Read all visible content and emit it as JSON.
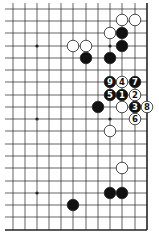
{
  "diagram": {
    "type": "go-board-partial",
    "grid": {
      "x0": 5,
      "xs": [
        13,
        25,
        37,
        49,
        61,
        73,
        86,
        98,
        110,
        122,
        135,
        147
      ],
      "ys": [
        9,
        21,
        33,
        46,
        58,
        70,
        82,
        95,
        107,
        119,
        131,
        144,
        156,
        168,
        181,
        193,
        205,
        217,
        230
      ],
      "top_edge_open": true,
      "left_edge_open": true,
      "right_edge": 147,
      "bottom_edge": 230
    },
    "hoshi": [
      [
        37,
        46
      ],
      [
        110,
        46
      ],
      [
        37,
        119
      ],
      [
        110,
        119
      ],
      [
        37,
        193
      ]
    ],
    "stones": [
      {
        "color": "white",
        "x": 122,
        "y": 20,
        "label": ""
      },
      {
        "color": "white",
        "x": 135,
        "y": 20,
        "label": ""
      },
      {
        "color": "white",
        "x": 110,
        "y": 33,
        "label": ""
      },
      {
        "color": "black",
        "x": 122,
        "y": 33,
        "label": ""
      },
      {
        "color": "white",
        "x": 73,
        "y": 46,
        "label": ""
      },
      {
        "color": "white",
        "x": 86,
        "y": 46,
        "label": ""
      },
      {
        "color": "black",
        "x": 122,
        "y": 46,
        "label": ""
      },
      {
        "color": "black",
        "x": 86,
        "y": 58,
        "label": ""
      },
      {
        "color": "black",
        "x": 110,
        "y": 58,
        "label": ""
      },
      {
        "color": "black",
        "x": 110,
        "y": 82,
        "label": "9"
      },
      {
        "color": "white",
        "x": 122,
        "y": 82,
        "label": "4"
      },
      {
        "color": "black",
        "x": 135,
        "y": 82,
        "label": "7"
      },
      {
        "color": "black",
        "x": 110,
        "y": 95,
        "label": "5"
      },
      {
        "color": "black",
        "x": 122,
        "y": 95,
        "label": "1"
      },
      {
        "color": "white",
        "x": 135,
        "y": 95,
        "label": "2"
      },
      {
        "color": "black",
        "x": 98,
        "y": 107,
        "label": ""
      },
      {
        "color": "white",
        "x": 122,
        "y": 107,
        "label": ""
      },
      {
        "color": "black",
        "x": 135,
        "y": 107,
        "label": "3"
      },
      {
        "color": "white",
        "x": 147,
        "y": 107,
        "label": "8"
      },
      {
        "color": "white",
        "x": 135,
        "y": 119,
        "label": "6"
      },
      {
        "color": "white",
        "x": 110,
        "y": 131,
        "label": ""
      },
      {
        "color": "white",
        "x": 122,
        "y": 168,
        "label": ""
      },
      {
        "color": "black",
        "x": 110,
        "y": 193,
        "label": ""
      },
      {
        "color": "black",
        "x": 122,
        "y": 193,
        "label": ""
      },
      {
        "color": "black",
        "x": 73,
        "y": 205,
        "label": ""
      }
    ],
    "colors": {
      "line": "#222222",
      "black": "#111111",
      "white": "#ffffff",
      "bg": "#ffffff"
    }
  }
}
